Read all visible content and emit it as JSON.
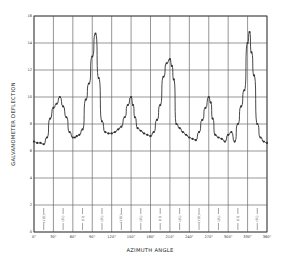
{
  "chart_data": {
    "type": "line",
    "title": "",
    "xlabel": "AZIMUTH ANGLE",
    "ylabel": "GALVANOMETER DEFLECTION",
    "xlim": [
      0,
      360
    ],
    "ylim": [
      0,
      16
    ],
    "grid": true,
    "x_ticks": [
      0,
      30,
      60,
      90,
      120,
      150,
      180,
      210,
      240,
      270,
      300,
      330,
      360
    ],
    "x_tick_labels": [
      "0°",
      "30°",
      "60°",
      "90°",
      "120°",
      "150°",
      "180°",
      "210°",
      "240°",
      "270°",
      "300°",
      "330°",
      "360°"
    ],
    "y_ticks": [
      0,
      2,
      4,
      6,
      8,
      10,
      12,
      14,
      16
    ],
    "y_tick_labels": [
      "0",
      "2",
      "4",
      "6",
      "8",
      "10",
      "12",
      "14",
      "16"
    ],
    "annotations": [
      "(VIII)",
      "(IV)",
      "(II)",
      "(IV)",
      "(VIII)",
      "(IV)",
      "(II)",
      "(IV)",
      "(VIII)",
      "(IV)",
      "(II)",
      "(IV)"
    ],
    "annotation_x": [
      15,
      45,
      75,
      105,
      135,
      165,
      195,
      225,
      255,
      285,
      315,
      345
    ],
    "series": [
      {
        "name": "deflection",
        "x": [
          0,
          5,
          10,
          15,
          20,
          25,
          30,
          35,
          40,
          45,
          50,
          55,
          60,
          63,
          66,
          70,
          75,
          80,
          85,
          90,
          95,
          100,
          105,
          110,
          115,
          120,
          125,
          130,
          135,
          140,
          145,
          150,
          153,
          156,
          160,
          165,
          170,
          175,
          180,
          185,
          190,
          195,
          200,
          205,
          210,
          213,
          216,
          220,
          225,
          230,
          235,
          240,
          245,
          250,
          255,
          260,
          265,
          270,
          273,
          276,
          280,
          285,
          290,
          295,
          300,
          305,
          310,
          315,
          320,
          325,
          330,
          333,
          336,
          340,
          345,
          350,
          355,
          360
        ],
        "y": [
          6.7,
          6.6,
          6.6,
          6.5,
          7.0,
          8.4,
          9.2,
          9.5,
          10.0,
          9.3,
          8.5,
          7.4,
          7.0,
          7.0,
          7.1,
          7.2,
          7.6,
          9.8,
          11.0,
          13.0,
          14.7,
          11.4,
          8.2,
          7.4,
          7.3,
          7.3,
          7.4,
          7.6,
          7.8,
          8.5,
          9.4,
          10.0,
          9.4,
          8.5,
          7.7,
          7.5,
          7.3,
          7.2,
          7.1,
          7.4,
          8.3,
          9.4,
          11.5,
          12.5,
          12.8,
          12.3,
          11.3,
          8.0,
          7.7,
          7.4,
          7.2,
          7.0,
          6.9,
          6.8,
          7.4,
          8.3,
          9.2,
          10.0,
          9.6,
          8.4,
          7.2,
          7.0,
          6.9,
          6.7,
          7.2,
          7.4,
          6.7,
          8.0,
          9.3,
          10.5,
          14.0,
          14.8,
          13.3,
          11.6,
          8.0,
          7.0,
          6.7,
          6.6
        ]
      }
    ]
  }
}
